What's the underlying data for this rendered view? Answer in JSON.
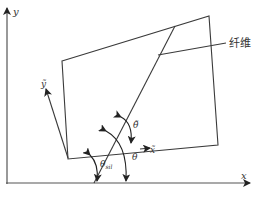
{
  "diagram": {
    "type": "fiber orientation coordinate diagram",
    "colors": {
      "line": "#3a3a3a",
      "axis": "#555555",
      "text": "#333333"
    },
    "labels": {
      "global_y": "y",
      "global_x": "x",
      "local_y": "ỹ",
      "local_x": "x̃",
      "fiber": "纤维",
      "theta_tilde": "θ̃",
      "theta": "θ",
      "theta_sub_main": "θ",
      "theta_sub_sub": "sil"
    }
  }
}
